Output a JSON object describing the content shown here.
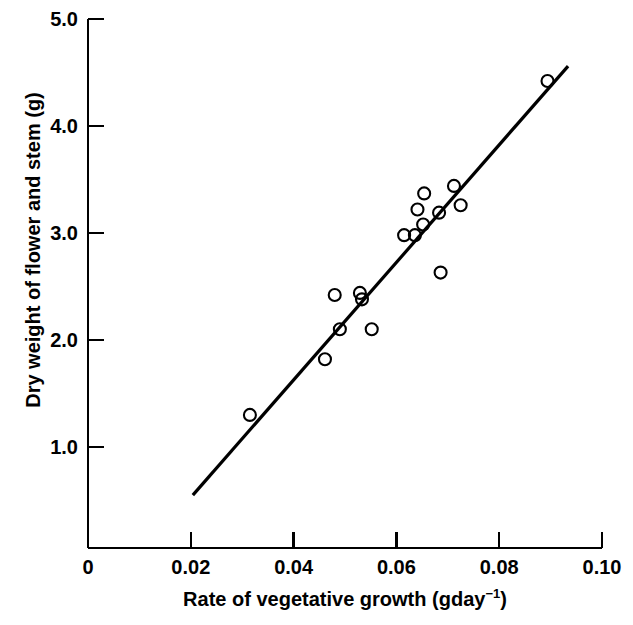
{
  "chart_data": {
    "type": "scatter",
    "title": "",
    "xlabel": "Rate of vegetative growth (gday−1)",
    "xlabel_base": "Rate of vegetative growth (gday",
    "xlabel_exponent": "−1",
    "xlabel_tail": ")",
    "ylabel": "Dry weight of flower and stem (g)",
    "xlim": [
      0,
      0.1
    ],
    "ylim": [
      0,
      5.0
    ],
    "grid": false,
    "legend": null,
    "xticks": [
      0,
      0.02,
      0.04,
      0.06,
      0.08,
      0.1
    ],
    "xtick_labels": [
      "0",
      "0.02",
      "0.04",
      "0.06",
      "0.08",
      "0.10"
    ],
    "yticks": [
      1.0,
      2.0,
      3.0,
      4.0,
      5.0
    ],
    "ytick_labels": [
      "1.0",
      "2.0",
      "3.0",
      "4.0",
      "5.0"
    ],
    "marker": "open-circle",
    "marker_color": "#000000",
    "marker_radius_px": 6,
    "points": [
      {
        "x": 0.0315,
        "y": 1.3
      },
      {
        "x": 0.0461,
        "y": 1.82
      },
      {
        "x": 0.048,
        "y": 2.42
      },
      {
        "x": 0.049,
        "y": 2.1
      },
      {
        "x": 0.0529,
        "y": 2.44
      },
      {
        "x": 0.0533,
        "y": 2.38
      },
      {
        "x": 0.0552,
        "y": 2.1
      },
      {
        "x": 0.0615,
        "y": 2.98
      },
      {
        "x": 0.0636,
        "y": 2.98
      },
      {
        "x": 0.0641,
        "y": 3.22
      },
      {
        "x": 0.0652,
        "y": 3.08
      },
      {
        "x": 0.0654,
        "y": 3.37
      },
      {
        "x": 0.0683,
        "y": 3.19
      },
      {
        "x": 0.0686,
        "y": 2.63
      },
      {
        "x": 0.0712,
        "y": 3.44
      },
      {
        "x": 0.0725,
        "y": 3.26
      },
      {
        "x": 0.0894,
        "y": 4.42
      }
    ],
    "trend_line": {
      "type": "linear-fit",
      "x_start": 0.0204,
      "y_start": 0.55,
      "x_end": 0.0934,
      "y_end": 4.56,
      "color": "#000000",
      "width_px": 3.2
    },
    "axis": {
      "color": "#000000",
      "width_px": 2.2,
      "spines": [
        "left",
        "bottom"
      ],
      "tick_direction": "out"
    }
  }
}
